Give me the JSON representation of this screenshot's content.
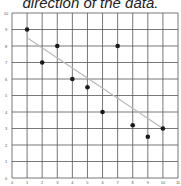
{
  "title_text": "direction of the data.",
  "chart_data": {
    "type": "scatter",
    "title": "direction of the data.",
    "xlabel": "",
    "ylabel": "",
    "xlim": [
      0,
      11
    ],
    "ylim": [
      0,
      10
    ],
    "grid": true,
    "x_ticks": [
      0,
      1,
      2,
      3,
      4,
      5,
      6,
      7,
      8,
      9,
      10,
      11
    ],
    "y_ticks": [
      0,
      1,
      2,
      3,
      4,
      5,
      6,
      7,
      8,
      9,
      10
    ],
    "series": [
      {
        "name": "data",
        "x": [
          1,
          2,
          3,
          4,
          5,
          6,
          7,
          8,
          9,
          10
        ],
        "y": [
          9,
          7,
          8,
          6,
          5.5,
          4,
          8,
          3.2,
          2.5,
          3
        ]
      }
    ],
    "trend_line": {
      "x": [
        1,
        10
      ],
      "y": [
        8.5,
        3
      ],
      "color": "#bbbbbb"
    },
    "point_color": "#1a1a1a",
    "grid_color": "#555555"
  }
}
